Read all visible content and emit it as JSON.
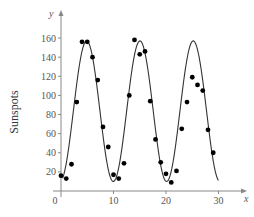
{
  "chart_data": {
    "type": "scatter",
    "title": "",
    "xlabel": "x",
    "ylabel": "Sunspots",
    "y_axis_var": "y",
    "x_axis_var": "x",
    "xlim": [
      0,
      35
    ],
    "ylim": [
      0,
      175
    ],
    "x_ticks": [
      0,
      10,
      20,
      30
    ],
    "y_ticks": [
      20,
      40,
      60,
      80,
      100,
      120,
      140,
      160
    ],
    "grid": false,
    "legend": null,
    "series": [
      {
        "name": "observed",
        "kind": "scatter",
        "x": [
          0,
          1,
          2,
          3,
          4,
          5,
          6,
          7,
          8,
          9,
          10,
          11,
          12,
          13,
          14,
          15,
          16,
          17,
          18,
          19,
          20,
          21,
          22,
          23,
          24,
          25,
          26,
          27,
          28,
          29
        ],
        "y": [
          16,
          13,
          28,
          93,
          156,
          156,
          140,
          116,
          67,
          46,
          17,
          13,
          29,
          100,
          158,
          143,
          146,
          94,
          54,
          30,
          18,
          9,
          21,
          65,
          93,
          119,
          111,
          105,
          64,
          40
        ]
      },
      {
        "name": "sinusoidal model",
        "kind": "line",
        "model": "y = 83.5 + 73.5 sin(2*pi*(x - 2.35)/10.15)",
        "params": {
          "mean": 83.5,
          "amplitude": 73.5,
          "period": 10.15,
          "phase_shift": 2.35
        },
        "x_range": [
          0.3,
          30
        ]
      }
    ]
  },
  "axes": {
    "y_var_label": "y",
    "x_var_label": "x",
    "y_title": "Sunspots",
    "x_tick_labels": [
      "0",
      "10",
      "20",
      "30"
    ],
    "y_tick_labels": [
      "20",
      "40",
      "60",
      "80",
      "100",
      "120",
      "140",
      "160"
    ]
  },
  "colors": {
    "axis": "#888888",
    "curve": "#333333",
    "points": "#000000"
  }
}
